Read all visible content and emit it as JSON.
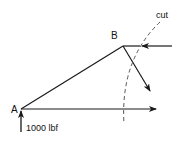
{
  "diagram": {
    "labels": {
      "node_a": "A",
      "node_b": "B",
      "cut": "cut",
      "load": "1000 lbf"
    },
    "colors": {
      "stroke": "#1a1a1a",
      "background": "#ffffff"
    }
  }
}
